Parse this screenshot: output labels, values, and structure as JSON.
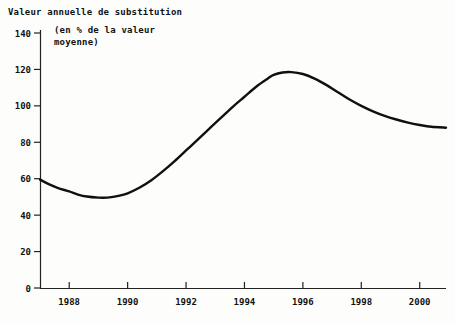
{
  "chart_data": {
    "type": "line",
    "title": "Valeur annuelle de substitution",
    "subtitle_line1": "(en % de la valeur",
    "subtitle_line2": "moyenne)",
    "xlabel": "",
    "ylabel": "",
    "xlim": [
      1987.0,
      2000.9
    ],
    "ylim": [
      0,
      140
    ],
    "grid": false,
    "legend": null,
    "line_color": "#101010",
    "axis_color": "#222222",
    "background": "#fdfdfb",
    "yticks": [
      0,
      20,
      40,
      60,
      80,
      100,
      120,
      140
    ],
    "ytick_labels": [
      "0",
      "20",
      "40",
      "60",
      "80",
      "100",
      "120",
      "140"
    ],
    "xticks": [
      1988,
      1990,
      1992,
      1994,
      1996,
      1998,
      2000
    ],
    "xtick_labels": [
      "1988",
      "1990",
      "1992",
      "1994",
      "1996",
      "1998",
      "2000"
    ],
    "series": [
      {
        "name": "Valeur annuelle de substitution",
        "x": [
          1987.0,
          1987.3,
          1987.6,
          1988.0,
          1988.3,
          1988.6,
          1989.0,
          1989.3,
          1989.6,
          1990.0,
          1990.4,
          1990.8,
          1991.2,
          1991.6,
          1992.0,
          1992.4,
          1992.8,
          1993.2,
          1993.6,
          1994.0,
          1994.4,
          1994.8,
          1995.0,
          1995.3,
          1995.6,
          1996.0,
          1996.4,
          1996.8,
          1997.2,
          1997.6,
          1998.0,
          1998.4,
          1998.8,
          1999.2,
          1999.6,
          2000.0,
          2000.4,
          2000.9
        ],
        "y": [
          59.5,
          57.0,
          55.0,
          53.0,
          51.3,
          50.2,
          49.6,
          49.6,
          50.3,
          52.0,
          55.0,
          59.0,
          64.0,
          69.5,
          75.5,
          81.5,
          87.5,
          93.5,
          99.5,
          105.0,
          110.5,
          115.0,
          117.0,
          118.3,
          118.5,
          117.5,
          115.0,
          111.5,
          107.5,
          103.5,
          100.0,
          97.0,
          94.5,
          92.5,
          90.8,
          89.5,
          88.5,
          88.0
        ]
      }
    ]
  },
  "figure": {
    "plot_left_px": 40,
    "plot_right_px": 446,
    "plot_top_px": 33,
    "plot_bottom_px": 288
  }
}
